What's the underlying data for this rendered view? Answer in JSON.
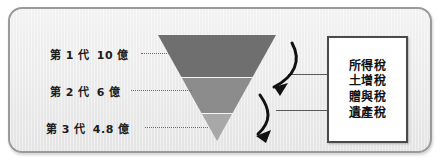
{
  "diagram": {
    "type": "inverted-pyramid-wealth-transfer",
    "generations": [
      {
        "id": "gen1",
        "label": "第 1 代",
        "amount": "10 億",
        "value": 10.0,
        "unit": "億",
        "band_color": "#6f6f6f"
      },
      {
        "id": "gen2",
        "label": "第 2 代",
        "amount": "6 億",
        "value": 6.0,
        "unit": "億",
        "band_color": "#8c8c8c"
      },
      {
        "id": "gen3",
        "label": "第 3 代",
        "amount": "4.8 億",
        "value": 4.8,
        "unit": "億",
        "band_color": "#a8a8a8"
      }
    ],
    "tax_box": {
      "items": [
        {
          "label": "所得稅"
        },
        {
          "label": "土增稅"
        },
        {
          "label": "贈與稅"
        },
        {
          "label": "遺產稅"
        }
      ]
    },
    "arrows": {
      "count": 2,
      "direction": "down-left",
      "meaning": "taxes erode wealth at each generational transfer"
    },
    "colors": {
      "frame_border": "#9a9a9a",
      "frame_background": "#ececec",
      "box_border": "#4a4a4a",
      "text": "#1c1c1c",
      "leader_line": "#6d6d6d",
      "connector_line": "#5a5a5a"
    }
  }
}
